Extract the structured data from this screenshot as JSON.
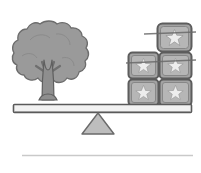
{
  "scene": {
    "title": "Balance scale with tree and star blocks",
    "width": 201,
    "height": 173,
    "background_color": "#ffffff"
  },
  "colors": {
    "tree_canopy_fill": "#9a9a9a",
    "tree_canopy_stroke": "#6d6d6d",
    "tree_trunk_fill": "#8e8e8e",
    "tree_trunk_stroke": "#5f5f5f",
    "beam_fill": "#f2f2f2",
    "beam_stroke": "#5a5a5a",
    "fulcrum_fill": "#bdbdbd",
    "fulcrum_stroke": "#6a6a6a",
    "block_fill": "#a3a3a3",
    "block_stroke": "#5d5d5d",
    "block_inner_fill": "#b6b6b6",
    "star_fill": "#ededed",
    "star_stroke": "#8a8a8a",
    "ground_line": "#c9c9c9"
  },
  "tree": {
    "label": "tree",
    "side": "left",
    "canopy_label": "leafy canopy",
    "trunk_label": "forked trunk"
  },
  "beam": {
    "label": "balance beam",
    "state": "level"
  },
  "fulcrum": {
    "label": "triangular fulcrum pivot"
  },
  "ground": {
    "label": "ground line"
  },
  "blocks": {
    "label": "stack of star blocks",
    "count": 5,
    "rows": [
      {
        "row": "bottom",
        "items": [
          {
            "id": "block-bottom-left",
            "x": 128,
            "y": 79,
            "w": 31,
            "h": 27,
            "star": true
          },
          {
            "id": "block-bottom-right",
            "x": 159,
            "y": 79,
            "w": 33,
            "h": 27,
            "star": true
          }
        ]
      },
      {
        "row": "middle",
        "items": [
          {
            "id": "block-middle-left",
            "x": 128,
            "y": 52,
            "w": 31,
            "h": 27,
            "star": true
          },
          {
            "id": "block-middle-right",
            "x": 159,
            "y": 52,
            "w": 33,
            "h": 27,
            "star": true
          }
        ]
      },
      {
        "row": "top",
        "items": [
          {
            "id": "block-top-right",
            "x": 157,
            "y": 23,
            "w": 35,
            "h": 29,
            "star": true
          }
        ]
      }
    ]
  }
}
